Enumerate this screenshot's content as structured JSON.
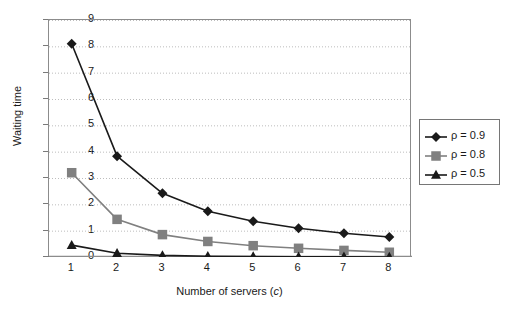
{
  "chart_data": {
    "type": "line",
    "title": "",
    "xlabel": "Number of servers (c)",
    "ylabel": "Waiting time",
    "x": [
      1,
      2,
      3,
      4,
      5,
      6,
      7,
      8
    ],
    "xlim": [
      0.5,
      8.5
    ],
    "ylim": [
      0,
      9
    ],
    "yticks": [
      0,
      1,
      2,
      3,
      4,
      5,
      6,
      7,
      8,
      9
    ],
    "xticks": [
      1,
      2,
      3,
      4,
      5,
      6,
      7,
      8
    ],
    "grid": "horizontal-dotted",
    "legend_position": "right-outside",
    "series": [
      {
        "name": "ρ = 0.9",
        "marker": "diamond",
        "color": "#1a1a1a",
        "values": [
          8.1,
          3.83,
          2.42,
          1.74,
          1.36,
          1.09,
          0.9,
          0.76
        ]
      },
      {
        "name": "ρ = 0.8",
        "marker": "square",
        "color": "#808080",
        "values": [
          3.2,
          1.43,
          0.85,
          0.59,
          0.43,
          0.33,
          0.25,
          0.18
        ]
      },
      {
        "name": "ρ = 0.5",
        "marker": "triangle",
        "color": "#1a1a1a",
        "values": [
          0.45,
          0.14,
          0.06,
          0.03,
          0.02,
          0.01,
          0.01,
          0.0
        ]
      }
    ]
  },
  "axes": {
    "ytick_labels": [
      "9",
      "8",
      "7",
      "6",
      "5",
      "4",
      "3",
      "2",
      "1",
      "0"
    ],
    "xtick_labels": [
      "1",
      "2",
      "3",
      "4",
      "5",
      "6",
      "7",
      "8"
    ],
    "ylabel": "Waiting time",
    "xlabel_prefix": "Number of servers (",
    "xlabel_italic": "c",
    "xlabel_suffix": ")"
  },
  "legend": {
    "items": [
      {
        "label": "ρ = 0.9"
      },
      {
        "label": "ρ = 0.8"
      },
      {
        "label": "ρ = 0.5"
      }
    ]
  },
  "colors": {
    "series_dark": "#1a1a1a",
    "series_gray": "#808080",
    "axis": "#8c8c8c",
    "grid": "#bdbdbd",
    "background": "#ffffff"
  }
}
